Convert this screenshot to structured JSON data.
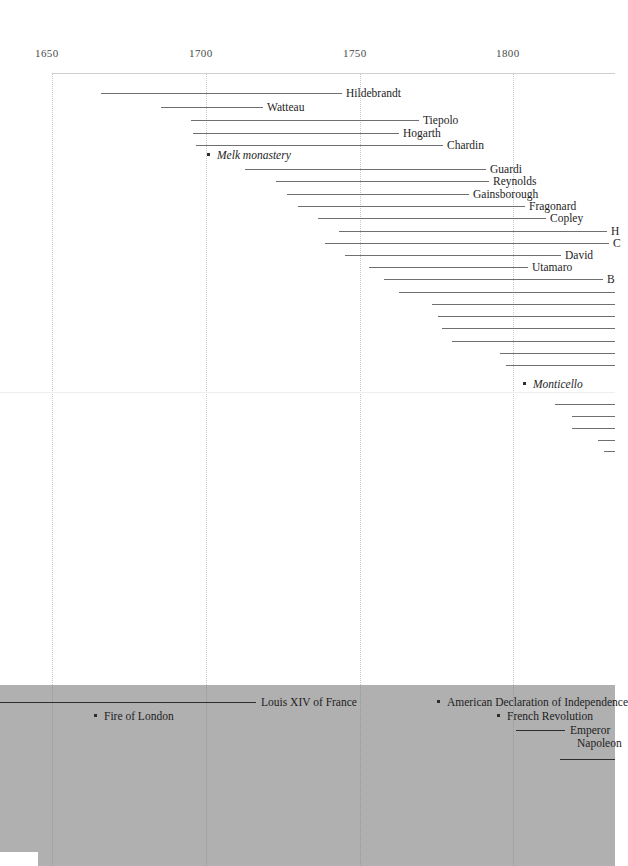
{
  "chart_data": {
    "type": "bar",
    "title": "",
    "subtitle": "",
    "xlabel": "",
    "ylabel": "",
    "orientation": "horizontal-timeline",
    "grid": true,
    "legend": "none",
    "xlim": [
      1633,
      1816
    ],
    "axis": {
      "ticks": [
        {
          "label": "1650",
          "value": 1650,
          "x": 52
        },
        {
          "label": "1700",
          "value": 1700,
          "x": 206
        },
        {
          "label": "1750",
          "value": 1750,
          "x": 360
        },
        {
          "label": "1800",
          "value": 1800,
          "x": 513
        }
      ],
      "pixels_per_50_years": 153.7
    },
    "colors": {
      "background": "#ffffff",
      "band": "#b0b0b0",
      "bar": "#6f6f6f",
      "band_bar": "#2d2d2d",
      "gridline": "#c8c8c8",
      "text": "#1d1d1d",
      "axis_text": "#4a4a4a"
    },
    "people": [
      {
        "label": "Hildebrandt",
        "x1": 101,
        "x2": 342,
        "y": 86,
        "label_side": "right-of-bar"
      },
      {
        "label": "Watteau",
        "x1": 161,
        "x2": 263,
        "y": 100,
        "label_side": "right-of-bar"
      },
      {
        "label": "Tiepolo",
        "x1": 191,
        "x2": 419,
        "y": 113,
        "label_side": "right-of-bar"
      },
      {
        "label": "Hogarth",
        "x1": 193,
        "x2": 399,
        "y": 126,
        "label_side": "right-of-bar"
      },
      {
        "label": "Chardin",
        "x1": 196,
        "x2": 443,
        "y": 138,
        "label_side": "right-of-bar"
      },
      {
        "label": "Guardi",
        "x1": 245,
        "x2": 486,
        "y": 162,
        "label_side": "right-of-bar"
      },
      {
        "label": "Reynolds",
        "x1": 276,
        "x2": 489,
        "y": 174,
        "label_side": "right-of-bar"
      },
      {
        "label": "Gainsborough",
        "x1": 287,
        "x2": 469,
        "y": 187,
        "label_side": "right-of-bar"
      },
      {
        "label": "Fragonard",
        "x1": 298,
        "x2": 525,
        "y": 199,
        "label_side": "right-of-bar"
      },
      {
        "label": "Copley",
        "x1": 318,
        "x2": 546,
        "y": 211,
        "label_side": "right-of-bar"
      },
      {
        "label": "H",
        "x1": 339,
        "x2": 607,
        "y": 224,
        "label_side": "right-of-bar"
      },
      {
        "label": "C",
        "x1": 325,
        "x2": 609,
        "y": 236,
        "label_side": "right-of-bar"
      },
      {
        "label": "David",
        "x1": 345,
        "x2": 561,
        "y": 248,
        "label_side": "right-of-bar"
      },
      {
        "label": "Utamaro",
        "x1": 369,
        "x2": 528,
        "y": 260,
        "label_side": "right-of-bar"
      },
      {
        "label": "B",
        "x1": 384,
        "x2": 603,
        "y": 272,
        "label_side": "right-of-bar"
      },
      {
        "label": "",
        "x1": 399,
        "x2": 615,
        "y": 285,
        "label_side": "offscreen"
      },
      {
        "label": "",
        "x1": 432,
        "x2": 615,
        "y": 297,
        "label_side": "offscreen"
      },
      {
        "label": "",
        "x1": 438,
        "x2": 615,
        "y": 309,
        "label_side": "offscreen"
      },
      {
        "label": "",
        "x1": 442,
        "x2": 615,
        "y": 321,
        "label_side": "offscreen"
      },
      {
        "label": "",
        "x1": 452,
        "x2": 615,
        "y": 334,
        "label_side": "offscreen"
      },
      {
        "label": "",
        "x1": 500,
        "x2": 615,
        "y": 346,
        "label_side": "offscreen"
      },
      {
        "label": "",
        "x1": 506,
        "x2": 615,
        "y": 358,
        "label_side": "offscreen"
      },
      {
        "label": "",
        "x1": 555,
        "x2": 615,
        "y": 397,
        "label_side": "offscreen"
      },
      {
        "label": "",
        "x1": 572,
        "x2": 615,
        "y": 409,
        "label_side": "offscreen"
      },
      {
        "label": "",
        "x1": 572,
        "x2": 615,
        "y": 421,
        "label_side": "offscreen"
      },
      {
        "label": "",
        "x1": 598,
        "x2": 615,
        "y": 433,
        "label_side": "offscreen"
      },
      {
        "label": "",
        "x1": 604,
        "x2": 615,
        "y": 444,
        "label_side": "offscreen"
      }
    ],
    "monuments": [
      {
        "label": "Melk monastery",
        "x": 207,
        "y": 148,
        "style": "italic",
        "label_side": "right-of-dot"
      },
      {
        "label": "Monticello",
        "x": 523,
        "y": 377,
        "style": "italic",
        "label_side": "right-of-dot"
      }
    ],
    "events": [
      {
        "label": "Louis XIV of France",
        "type": "bar",
        "x1": 0,
        "x2": 256,
        "y": 695,
        "label_side": "right-of-bar"
      },
      {
        "label": "Fire of London",
        "type": "point",
        "x": 94,
        "y": 709,
        "label_side": "right-of-dot"
      },
      {
        "label": "American Declaration of Independence",
        "type": "point",
        "x": 437,
        "y": 695,
        "label_side": "right-of-dot"
      },
      {
        "label": "French Revolution",
        "type": "point",
        "x": 497,
        "y": 709,
        "label_side": "right-of-dot"
      },
      {
        "label": "Emperor",
        "type": "bar",
        "x1": 516,
        "x2": 565,
        "y": 723,
        "label_side": "right-of-bar"
      },
      {
        "label": "Napoleon",
        "type": "text",
        "x": 577,
        "y": 736,
        "label_side": "text-only"
      },
      {
        "label": "",
        "type": "bar",
        "x1": 560,
        "x2": 615,
        "y": 752,
        "label_side": "offscreen"
      }
    ]
  },
  "layout": {
    "chart_top_border_y": 73,
    "faint_midline_y": 392,
    "band_top_y": 685,
    "band_bottom_y": 866,
    "notch": {
      "x": 0,
      "y": 852,
      "w": 38,
      "h": 14
    }
  }
}
